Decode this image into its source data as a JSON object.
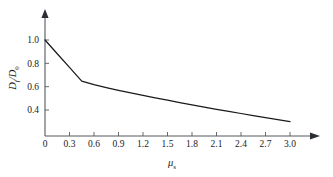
{
  "chart_data": {
    "type": "line",
    "title": "",
    "xlabel": "μₛ",
    "ylabel": "Dᶠ/D₀",
    "xlabel_base": "μ",
    "xlabel_sub": "s",
    "ylabel_num": "D",
    "ylabel_num_sub": "f",
    "ylabel_den": "D",
    "ylabel_den_sub": "0",
    "ylabel_slash": "/",
    "xlim": [
      0,
      3.0
    ],
    "ylim": [
      0.2,
      1.06
    ],
    "grid": false,
    "legend": false,
    "x_ticks": [
      "0",
      "0.3",
      "0.6",
      "0.9",
      "1.2",
      "1.5",
      "1.8",
      "2.1",
      "2.4",
      "2.7",
      "3.0"
    ],
    "x_tick_values": [
      0,
      0.3,
      0.6,
      0.9,
      1.2,
      1.5,
      1.8,
      2.1,
      2.4,
      2.7,
      3.0
    ],
    "y_ticks": [
      "0.4",
      "0.6",
      "0.8",
      "1.0"
    ],
    "y_tick_values": [
      0.4,
      0.6,
      0.8,
      1.0
    ],
    "series": [
      {
        "name": "D_f/D_0",
        "color": "#1a1a1a",
        "x": [
          0.0,
          0.15,
          0.3,
          0.45,
          0.6,
          0.75,
          0.9,
          1.05,
          1.2,
          1.35,
          1.5,
          1.65,
          1.8,
          1.95,
          2.1,
          2.25,
          2.4,
          2.55,
          2.7,
          2.85,
          3.0
        ],
        "y": [
          1.0,
          0.882,
          0.765,
          0.648,
          0.617,
          0.592,
          0.568,
          0.546,
          0.525,
          0.504,
          0.484,
          0.464,
          0.444,
          0.425,
          0.406,
          0.388,
          0.37,
          0.352,
          0.335,
          0.318,
          0.3
        ]
      }
    ],
    "annotations": []
  },
  "axes": {
    "x_axis_name": "x-axis",
    "y_axis_name": "y-axis"
  }
}
